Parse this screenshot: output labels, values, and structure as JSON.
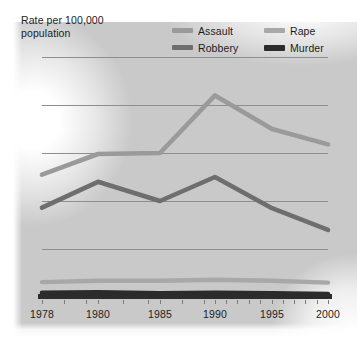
{
  "chart_data": {
    "type": "line",
    "title": "Rate per 100,000 population",
    "xlabel": "",
    "ylabel": "Rate per 100,000 population",
    "categories": [
      "1978",
      "1980",
      "1985",
      "1990",
      "1995",
      "2000"
    ],
    "ylim": [
      0,
      500
    ],
    "yticks": [
      0,
      100,
      200,
      300,
      400,
      500
    ],
    "grid": true,
    "legend_position": "top-right",
    "series": [
      {
        "name": "Assault",
        "color": "#9a9a9a",
        "values": [
          255,
          298,
          300,
          420,
          350,
          318
        ]
      },
      {
        "name": "Rape",
        "color": "#a8a8a8",
        "values": [
          31,
          34,
          34,
          36,
          34,
          30
        ]
      },
      {
        "name": "Robbery",
        "color": "#6e6e6e",
        "values": [
          186,
          240,
          200,
          250,
          185,
          140
        ]
      },
      {
        "name": "Murder",
        "color": "#2b2b2b",
        "values": [
          9,
          10,
          8,
          9,
          8,
          6
        ]
      }
    ]
  },
  "axes": {
    "y_tick_labels": [
      "500",
      "400",
      "300",
      "200",
      "100",
      "0"
    ],
    "x_tick_labels": [
      "1978",
      "1980",
      "1985",
      "1990",
      "1995",
      "2000"
    ]
  },
  "legend": {
    "items": [
      {
        "label": "Assault",
        "color": "#9a9a9a"
      },
      {
        "label": "Rape",
        "color": "#a8a8a8"
      },
      {
        "label": "Robbery",
        "color": "#6e6e6e"
      },
      {
        "label": "Murder",
        "color": "#2b2b2b"
      }
    ]
  },
  "header": {
    "axis_title": "Rate per 100,000\npopulation"
  }
}
